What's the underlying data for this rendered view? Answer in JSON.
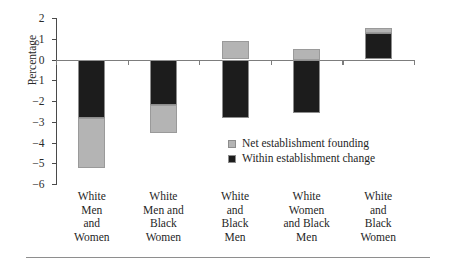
{
  "chart_data": {
    "type": "bar",
    "title": "",
    "subtitle": "",
    "xlabel": "",
    "ylabel": "Percentage",
    "stacked": true,
    "grid": false,
    "ylim": [
      -6,
      2
    ],
    "yticks": [
      2,
      1,
      0,
      -1,
      -2,
      -3,
      -4,
      -5,
      -6
    ],
    "ytick_labels": [
      "2",
      "1",
      "0",
      "−1",
      "−2",
      "−3",
      "−4",
      "−5",
      "−6"
    ],
    "legend_position": "center-right",
    "categories": [
      "White Men and Women",
      "White Men and Black Women",
      "White and Black Men",
      "White Women and Black Men",
      "White and Black Women"
    ],
    "category_lines": [
      [
        "White",
        "Men",
        "and",
        "Women"
      ],
      [
        "White",
        "Men and",
        "Black",
        "Women"
      ],
      [
        "White",
        "and",
        "Black",
        "Men"
      ],
      [
        "White",
        "Women",
        "and Black",
        "Men"
      ],
      [
        "White",
        "and",
        "Black",
        "Women"
      ]
    ],
    "series": [
      {
        "name": "Within establishment change",
        "color": "#1c1c1c",
        "values": [
          -2.8,
          -2.2,
          -2.8,
          -2.6,
          1.3
        ]
      },
      {
        "name": "Net establishment founding",
        "color": "#b4b4b4",
        "values": [
          -2.45,
          -1.35,
          0.9,
          0.5,
          0.2
        ]
      }
    ],
    "bar_segments": [
      {
        "category_index": 0,
        "dark_from": 0,
        "dark_to": -2.8,
        "light_from": -2.8,
        "light_to": -5.25
      },
      {
        "category_index": 1,
        "dark_from": 0,
        "dark_to": -2.2,
        "light_from": -2.2,
        "light_to": -3.55
      },
      {
        "category_index": 2,
        "dark_from": 0,
        "dark_to": -2.8,
        "light_from": 0.9,
        "light_to": 0
      },
      {
        "category_index": 3,
        "dark_from": 0,
        "dark_to": -2.6,
        "light_from": 0.5,
        "light_to": 0
      },
      {
        "category_index": 4,
        "dark_from": 0,
        "dark_to": 1.3,
        "light_from": 1.5,
        "light_to": 1.3
      }
    ]
  },
  "legend": {
    "items": [
      {
        "label": "Net establishment founding",
        "swatch": "light"
      },
      {
        "label": "Within establishment change",
        "swatch": "dark"
      }
    ]
  },
  "axis": {
    "y_title": "Percentage"
  }
}
